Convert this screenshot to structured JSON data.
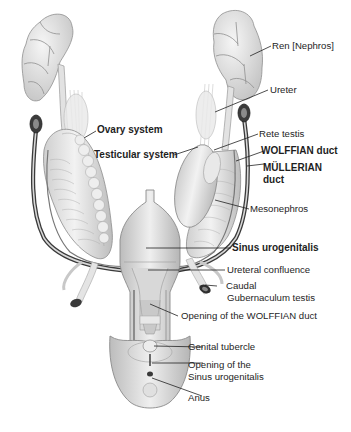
{
  "diagram": {
    "colors": {
      "background": "#ffffff",
      "tissue": "#e6e6e6",
      "tissue_shadow": "#b9b9b9",
      "outline": "#8a8a8a",
      "duct_dark": "#2b2b2b",
      "leader_line": "#222222",
      "label_text": "#1e1e1e"
    },
    "labels": {
      "ren": "Ren [Nephros]",
      "ureter": "Ureter",
      "ovary_system": "Ovary system",
      "rete_testis": "Rete testis",
      "testicular_system": "Testicular system",
      "wolffian_duct": "WOLFFIAN duct",
      "mullerian_duct_line1": "MÜLLERIAN",
      "mullerian_duct_line2": "duct",
      "mesonephros": "Mesonephros",
      "sinus_urogenitalis": "Sinus urogenitalis",
      "ureteral_confluence": "Ureteral confluence",
      "caudal_line1": "Caudal",
      "caudal_line2": "Gubernaculum testis",
      "opening_wolffian": "Opening of the WOLFFIAN duct",
      "genital_tubercle": "Genital tubercle",
      "opening_sinus_line1": "Opening of the",
      "opening_sinus_line2": "Sinus urogenitalis",
      "anus": "Anus"
    }
  }
}
